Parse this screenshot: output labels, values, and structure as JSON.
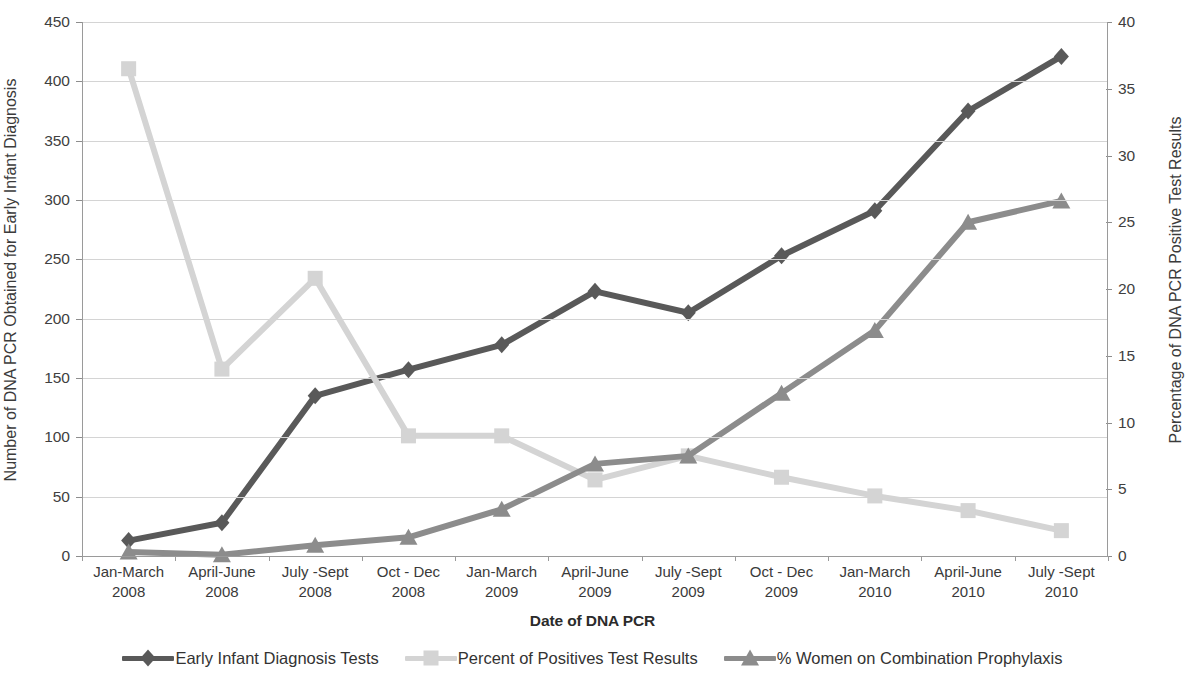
{
  "chart_data": {
    "type": "line",
    "title": "",
    "xlabel": "Date of DNA PCR",
    "ylabel": "Number of DNA PCR Obtained for Early Infant Diagnosis",
    "y2label": "Percentage of DNA PCR Positive Test Results",
    "ylim": [
      0,
      450
    ],
    "y2lim": [
      0,
      40
    ],
    "yticks": [
      0,
      50,
      100,
      150,
      200,
      250,
      300,
      350,
      400,
      450
    ],
    "y2ticks": [
      0,
      5,
      10,
      15,
      20,
      25,
      30,
      35,
      40
    ],
    "grid": true,
    "legend_position": "bottom",
    "categories": [
      "Jan-March 2008",
      "April-June 2008",
      "July -Sept 2008",
      "Oct - Dec 2008",
      "Jan-March 2009",
      "April-June 2009",
      "July -Sept 2009",
      "Oct - Dec 2009",
      "Jan-March 2010",
      "April-June 2010",
      "July -Sept 2010"
    ],
    "category_lines": [
      [
        "Jan-March",
        "2008"
      ],
      [
        "April-June",
        "2008"
      ],
      [
        "July -Sept",
        "2008"
      ],
      [
        "Oct - Dec",
        "2008"
      ],
      [
        "Jan-March",
        "2009"
      ],
      [
        "April-June",
        "2009"
      ],
      [
        "July -Sept",
        "2009"
      ],
      [
        "Oct - Dec",
        "2009"
      ],
      [
        "Jan-March",
        "2010"
      ],
      [
        "April-June",
        "2010"
      ],
      [
        "July -Sept",
        "2010"
      ]
    ],
    "series": [
      {
        "name": "Early Infant Diagnosis Tests",
        "axis": "left",
        "color": "#595959",
        "marker": "diamond",
        "values": [
          13,
          28,
          135,
          157,
          178,
          223,
          205,
          253,
          291,
          375,
          421
        ]
      },
      {
        "name": "Percent of Positives Test Results",
        "axis": "right",
        "color": "#d4d4d4",
        "marker": "square",
        "values": [
          36.5,
          14.0,
          20.8,
          9.0,
          9.0,
          5.7,
          7.5,
          5.9,
          4.5,
          3.4,
          1.9
        ]
      },
      {
        "name": "% Women on Combination Prophylaxis",
        "axis": "right",
        "color": "#8c8c8c",
        "marker": "triangle",
        "values": [
          0.3,
          0.1,
          0.8,
          1.4,
          3.5,
          6.9,
          7.5,
          12.2,
          16.9,
          25.0,
          26.6
        ]
      }
    ]
  },
  "legend": {
    "items": [
      {
        "label": "Early Infant Diagnosis Tests"
      },
      {
        "label": "Percent of Positives Test Results"
      },
      {
        "label": "% Women on Combination Prophylaxis"
      }
    ]
  }
}
